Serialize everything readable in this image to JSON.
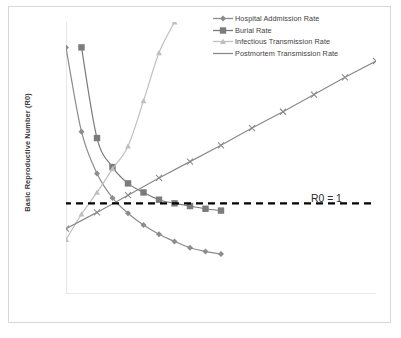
{
  "chart_data": {
    "type": "line",
    "title": "",
    "xlabel": "",
    "ylabel": "Basic Reproductive Number (R0)",
    "xlim": [
      0,
      2
    ],
    "ylim": [
      0,
      3
    ],
    "xticks": [
      0,
      0.5,
      1,
      1.5,
      2
    ],
    "xtick_labels": [
      "0",
      "0.5",
      "1",
      "1.5",
      "2"
    ],
    "yticks": [
      0,
      0.5,
      1,
      1.5,
      2,
      2.5,
      3
    ],
    "ytick_labels": [
      "0",
      "0.5",
      "1",
      "1.5",
      "2",
      "2.5",
      "3"
    ],
    "grid": false,
    "legend_position": "top-right",
    "annotations": [
      {
        "text": "R0 = 1",
        "x": 1.63,
        "y": 1.0
      }
    ],
    "reference_lines": [
      {
        "name": "R0 threshold",
        "orientation": "horizontal",
        "y": 1.0,
        "style": "dashed",
        "color": "#000000"
      }
    ],
    "series": [
      {
        "name": "Hospital Addmission Rate",
        "marker": "diamond",
        "color": "#8c8c8c",
        "x": [
          0,
          0.1,
          0.2,
          0.3,
          0.4,
          0.5,
          0.6,
          0.7,
          0.8,
          0.9,
          1.0
        ],
        "y": [
          2.72,
          1.79,
          1.33,
          1.06,
          0.89,
          0.76,
          0.66,
          0.58,
          0.51,
          0.47,
          0.44
        ]
      },
      {
        "name": "Burial Rate",
        "marker": "square",
        "color": "#7b7b7b",
        "x": [
          0.1,
          0.2,
          0.3,
          0.4,
          0.5,
          0.6,
          0.7,
          0.8,
          0.9,
          1.0
        ],
        "y": [
          2.72,
          1.72,
          1.4,
          1.22,
          1.12,
          1.04,
          1.0,
          0.97,
          0.94,
          0.92
        ]
      },
      {
        "name": "Infectious Transmission Rate",
        "marker": "triangle",
        "color": "#bfbfbf",
        "x": [
          0,
          0.1,
          0.2,
          0.3,
          0.4,
          0.5,
          0.6,
          0.7,
          0.75
        ],
        "y": [
          0.6,
          0.88,
          1.12,
          1.38,
          1.63,
          2.13,
          2.66,
          3.0,
          3.18
        ]
      },
      {
        "name": "Postmortem Transmission Rate",
        "marker": "x",
        "color": "#8a8a8a",
        "x": [
          0,
          0.2,
          0.4,
          0.6,
          0.8,
          1.0,
          1.2,
          1.4,
          1.6,
          1.8,
          2.0
        ],
        "y": [
          0.72,
          0.9,
          1.09,
          1.28,
          1.46,
          1.64,
          1.83,
          2.01,
          2.2,
          2.39,
          2.57
        ]
      }
    ]
  },
  "legend": {
    "items": [
      {
        "label": "Hospital Addmission Rate",
        "marker": "diamond",
        "color": "#8c8c8c"
      },
      {
        "label": "Burial Rate",
        "marker": "square",
        "color": "#7b7b7b"
      },
      {
        "label": "Infectious Transmission Rate",
        "marker": "triangle",
        "color": "#bfbfbf"
      },
      {
        "label": "Postmortem Transmission Rate",
        "marker": "line",
        "color": "#8a8a8a"
      }
    ]
  },
  "axes": {
    "ylabel": "Basic Reproductive Number (R0)"
  },
  "annotation": {
    "r0_label": "R0 = 1"
  }
}
